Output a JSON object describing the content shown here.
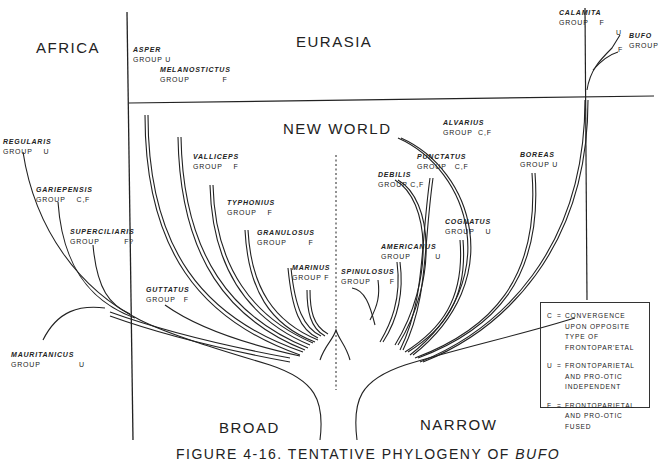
{
  "figure": {
    "caption_prefix": "FIGURE 4-16. TENTATIVE PHYLOGENY OF ",
    "caption_genus": "BUFO"
  },
  "regions": {
    "africa": "AFRICA",
    "eurasia": "EURASIA",
    "new_world": "NEW WORLD",
    "broad": "BROAD",
    "narrow": "NARROW"
  },
  "species_groups": [
    {
      "name": "ASPER",
      "group": "GROUP U",
      "region": "Eurasia"
    },
    {
      "name": "MELANOSTICTUS",
      "group": "GROUP            F",
      "region": "Eurasia"
    },
    {
      "name": "CALAMITA",
      "group": "GROUP    F",
      "region": "Eurasia"
    },
    {
      "name": "BUFO",
      "group": "GROUP",
      "region": "Eurasia",
      "branches": [
        "U",
        "F"
      ]
    },
    {
      "name": "REGULARIS",
      "group": "GROUP    U",
      "region": "Africa"
    },
    {
      "name": "GARIEPENSIS",
      "group": "GROUP    C,F",
      "region": "Africa"
    },
    {
      "name": "SUPERCILIARIS",
      "group": "GROUP         F?",
      "region": "Africa"
    },
    {
      "name": "MAURITANICUS",
      "group": "GROUP              U",
      "region": "Africa"
    },
    {
      "name": "VALLICEPS",
      "group": "GROUP    F",
      "region": "New World",
      "type": "Broad"
    },
    {
      "name": "TYPHONIUS",
      "group": "GROUP    F",
      "region": "New World",
      "type": "Broad"
    },
    {
      "name": "GRANULOSUS",
      "group": "GROUP        F",
      "region": "New World",
      "type": "Broad"
    },
    {
      "name": "MARINUS",
      "group": "GROUP F",
      "region": "New World",
      "type": "Broad"
    },
    {
      "name": "GUTTATUS",
      "group": "GROUP   F",
      "region": "New World",
      "type": "Broad"
    },
    {
      "name": "SPINULOSUS",
      "group": "GROUP       F",
      "region": "New World",
      "type": "Narrow"
    },
    {
      "name": "AMERICANUS",
      "group": "GROUP         U",
      "region": "New World",
      "type": "Narrow"
    },
    {
      "name": "DEBILIS",
      "group": "GROUP C,F",
      "region": "New World",
      "type": "Narrow"
    },
    {
      "name": "PUNCTATUS",
      "group": "GROUP   C,F",
      "region": "New World",
      "type": "Narrow"
    },
    {
      "name": "ALVARIUS",
      "group": "GROUP  C,F",
      "region": "New World",
      "type": "Narrow"
    },
    {
      "name": "COGNATUS",
      "group": "GROUP    U",
      "region": "New World",
      "type": "Narrow"
    },
    {
      "name": "BOREAS",
      "group": "GROUP U",
      "region": "New World",
      "type": "Narrow"
    }
  ],
  "bufo_branch_labels": {
    "upper": "U",
    "lower": "F"
  },
  "legend": [
    {
      "key": "C",
      "eq": "=",
      "text": "CONVERGENCE UPON OPPOSITE TYPE OF FRONTOPAR'ETAL"
    },
    {
      "key": "U",
      "eq": "=",
      "text": "FRONTOPARIETAL AND PRO-OTIC INDEPENDENT"
    },
    {
      "key": "F",
      "eq": "=",
      "text": "FRONTOPARIETAL AND PRO-OTIC FUSED"
    }
  ],
  "colors": {
    "ink": "#222222",
    "paper": "#ffffff"
  }
}
